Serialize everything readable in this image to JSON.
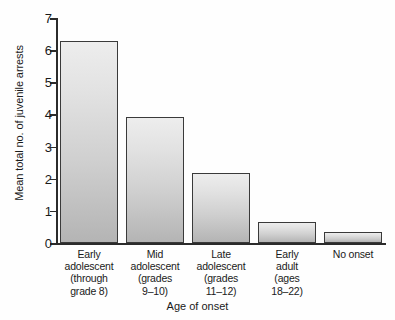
{
  "chart_data": {
    "type": "bar",
    "title": "",
    "xlabel": "Age of onset",
    "ylabel": "Mean total no. of juvenile arrests",
    "categories": [
      "Early\nadolescent\n(through\ngrade 8)",
      "Mid\nadolescent\n(grades\n9–10)",
      "Late\nadolescent\n(grades\n11–12)",
      "Early\nadult\n(ages\n18–22)",
      "No onset"
    ],
    "values": [
      6.28,
      3.91,
      2.18,
      0.64,
      0.33
    ],
    "ylim": [
      0,
      7
    ],
    "yticks": [
      "0",
      "1",
      "2",
      "3",
      "4",
      "5",
      "6",
      "7"
    ],
    "ytick_values": [
      0,
      1,
      2,
      3,
      4,
      5,
      6,
      7
    ],
    "grid": "off",
    "legend": "none",
    "bar_fill_top": "#ededed",
    "bar_fill_bottom": "#b4b4b4",
    "bar_border_color": "#3a3a3a",
    "axis_color": "#2b2b2b",
    "background": "#fefefe"
  }
}
